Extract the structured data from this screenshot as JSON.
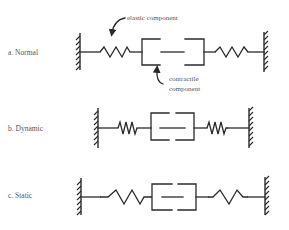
{
  "diagram": {
    "type": "muscle-model",
    "colors": {
      "line": "#2a2a2a",
      "text": "#555555",
      "background": "#ffffff"
    },
    "annotations": {
      "elastic": "elastic component",
      "contractile_line1": "contractile",
      "contractile_line2": "component"
    },
    "rows": [
      {
        "id": "a",
        "label": "a. Normal",
        "spring_state": "normal"
      },
      {
        "id": "b",
        "label": "b. Dynamic",
        "spring_state": "compressed"
      },
      {
        "id": "c",
        "label": "c. Static",
        "spring_state": "stretched"
      }
    ]
  }
}
